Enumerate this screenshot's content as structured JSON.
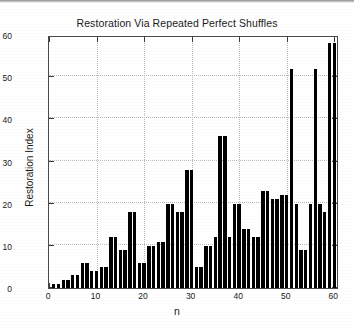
{
  "chart_data": {
    "type": "bar",
    "title": "Restoration Via Repeated Perfect Shuffles",
    "xlabel": "n",
    "ylabel": "Restoration Index",
    "xlim": [
      0,
      61
    ],
    "ylim": [
      0,
      60
    ],
    "grid": true,
    "legend": null,
    "bar_color": "#000000",
    "categories": [
      1,
      2,
      3,
      4,
      5,
      6,
      7,
      8,
      9,
      10,
      11,
      12,
      13,
      14,
      15,
      16,
      17,
      18,
      19,
      20,
      21,
      22,
      23,
      24,
      25,
      26,
      27,
      28,
      29,
      30,
      31,
      32,
      33,
      34,
      35,
      36,
      37,
      38,
      39,
      40,
      41,
      42,
      43,
      44,
      45,
      46,
      47,
      48,
      49,
      50,
      51,
      52,
      53,
      54,
      55,
      56,
      57,
      58,
      59,
      60
    ],
    "values": [
      1,
      1,
      2,
      2,
      3,
      3,
      6,
      6,
      4,
      4,
      5,
      5,
      12,
      12,
      9,
      9,
      18,
      18,
      6,
      6,
      10,
      10,
      11,
      11,
      20,
      20,
      18,
      18,
      28,
      28,
      5,
      5,
      10,
      10,
      12,
      36,
      36,
      12,
      20,
      20,
      14,
      14,
      12,
      12,
      23,
      23,
      21,
      21,
      22,
      22,
      52,
      20,
      9,
      9,
      20,
      52,
      20,
      18,
      58,
      58
    ],
    "x_ticks": [
      0,
      10,
      20,
      30,
      40,
      50,
      60
    ],
    "y_ticks": [
      0,
      10,
      20,
      30,
      40,
      50,
      60
    ]
  }
}
